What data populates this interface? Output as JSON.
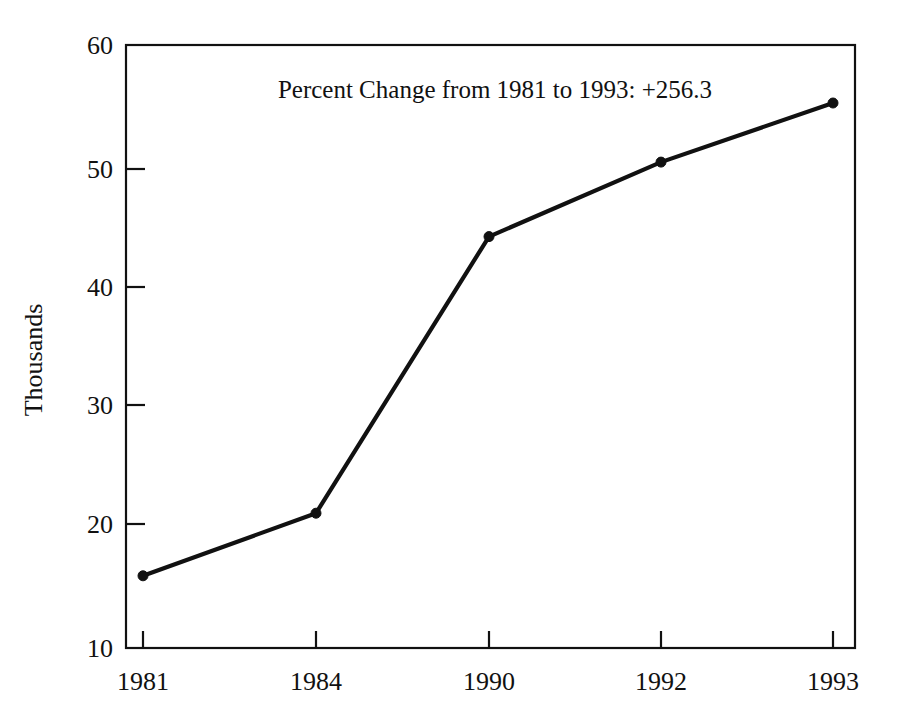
{
  "chart_data": {
    "type": "line",
    "title": "",
    "annotation": "Percent Change from 1981 to 1993:  +256.3",
    "xlabel": "",
    "ylabel": "Thousands",
    "categories": [
      "1981",
      "1984",
      "1990",
      "1992",
      "1993"
    ],
    "values": [
      15.6,
      20.9,
      44.3,
      50.6,
      55.6
    ],
    "series": [
      {
        "name": "Thousands",
        "values": [
          15.6,
          20.9,
          44.3,
          50.6,
          55.6
        ],
        "color": "#111111",
        "marker": "circle"
      }
    ],
    "ylim": [
      10,
      60
    ],
    "yticks": [
      10,
      20,
      30,
      40,
      50,
      60
    ],
    "ytick_labels": [
      "10",
      "20",
      "30",
      "40",
      "50",
      "60"
    ],
    "xtick_labels": [
      "1981",
      "1984",
      "1990",
      "1992",
      "1993"
    ],
    "grid": false,
    "legend": false,
    "legend_position": "none",
    "line_color": "#111111",
    "background_color": "#ffffff"
  },
  "labels": {
    "y_axis_title": "Thousands",
    "annotation": "Percent Change from 1981 to 1993:  +256.3",
    "y_60": "60",
    "y_50": "50",
    "y_40": "40",
    "y_30": "30",
    "y_20": "20",
    "y_10": "10",
    "x_1981": "1981",
    "x_1984": "1984",
    "x_1990": "1990",
    "x_1992": "1992",
    "x_1993": "1993"
  }
}
